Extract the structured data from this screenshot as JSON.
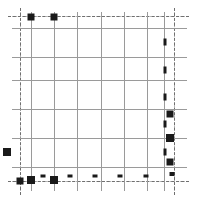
{
  "chart_data": {
    "type": "scatter",
    "title": "",
    "subtitle": "",
    "xlabel": "",
    "ylabel": "",
    "legend": [],
    "annotations": [],
    "grid": {
      "visible": true,
      "major_color": "#9a9a9a",
      "minor_color": "#b5b5b5",
      "axis_color": "#6f6f6f",
      "major_vertical_x": [
        31,
        54,
        77,
        101,
        124,
        147,
        164
      ],
      "major_horizontal_y": [
        28,
        57,
        80,
        109,
        138,
        167
      ],
      "minor_vertical_x": [
        20,
        174
      ],
      "minor_horizontal_y": [
        16,
        181
      ],
      "axis_vertical_x": [
        20,
        174
      ],
      "axis_horizontal_y": [
        16,
        181
      ]
    },
    "axis_ranges": {
      "xlim": [
        0,
        197
      ],
      "ylim": [
        0,
        203
      ]
    },
    "marker_color": "#1a1a1a",
    "points": [
      {
        "x": 31,
        "y": 17,
        "w": 7,
        "h": 7,
        "shape": "square"
      },
      {
        "x": 54,
        "y": 17,
        "w": 7,
        "h": 7,
        "shape": "square"
      },
      {
        "x": 165,
        "y": 42,
        "w": 3,
        "h": 7,
        "shape": "bar"
      },
      {
        "x": 165,
        "y": 70,
        "w": 3,
        "h": 7,
        "shape": "bar"
      },
      {
        "x": 165,
        "y": 97,
        "w": 3,
        "h": 7,
        "shape": "bar"
      },
      {
        "x": 170,
        "y": 114,
        "w": 7,
        "h": 7,
        "shape": "square"
      },
      {
        "x": 165,
        "y": 124,
        "w": 3,
        "h": 7,
        "shape": "bar"
      },
      {
        "x": 170,
        "y": 138,
        "w": 8,
        "h": 8,
        "shape": "square"
      },
      {
        "x": 165,
        "y": 152,
        "w": 3,
        "h": 7,
        "shape": "bar"
      },
      {
        "x": 170,
        "y": 162,
        "w": 7,
        "h": 7,
        "shape": "square"
      },
      {
        "x": 7,
        "y": 152,
        "w": 8,
        "h": 8,
        "shape": "square"
      },
      {
        "x": 20,
        "y": 181,
        "w": 7,
        "h": 7,
        "shape": "square"
      },
      {
        "x": 31,
        "y": 180,
        "w": 8,
        "h": 8,
        "shape": "square"
      },
      {
        "x": 43,
        "y": 176,
        "w": 5,
        "h": 3,
        "shape": "bar"
      },
      {
        "x": 54,
        "y": 180,
        "w": 8,
        "h": 8,
        "shape": "square"
      },
      {
        "x": 70,
        "y": 176,
        "w": 5,
        "h": 3,
        "shape": "bar"
      },
      {
        "x": 95,
        "y": 176,
        "w": 5,
        "h": 3,
        "shape": "bar"
      },
      {
        "x": 120,
        "y": 176,
        "w": 5,
        "h": 3,
        "shape": "bar"
      },
      {
        "x": 146,
        "y": 176,
        "w": 5,
        "h": 3,
        "shape": "bar"
      },
      {
        "x": 172,
        "y": 174,
        "w": 5,
        "h": 4,
        "shape": "bar"
      }
    ]
  }
}
